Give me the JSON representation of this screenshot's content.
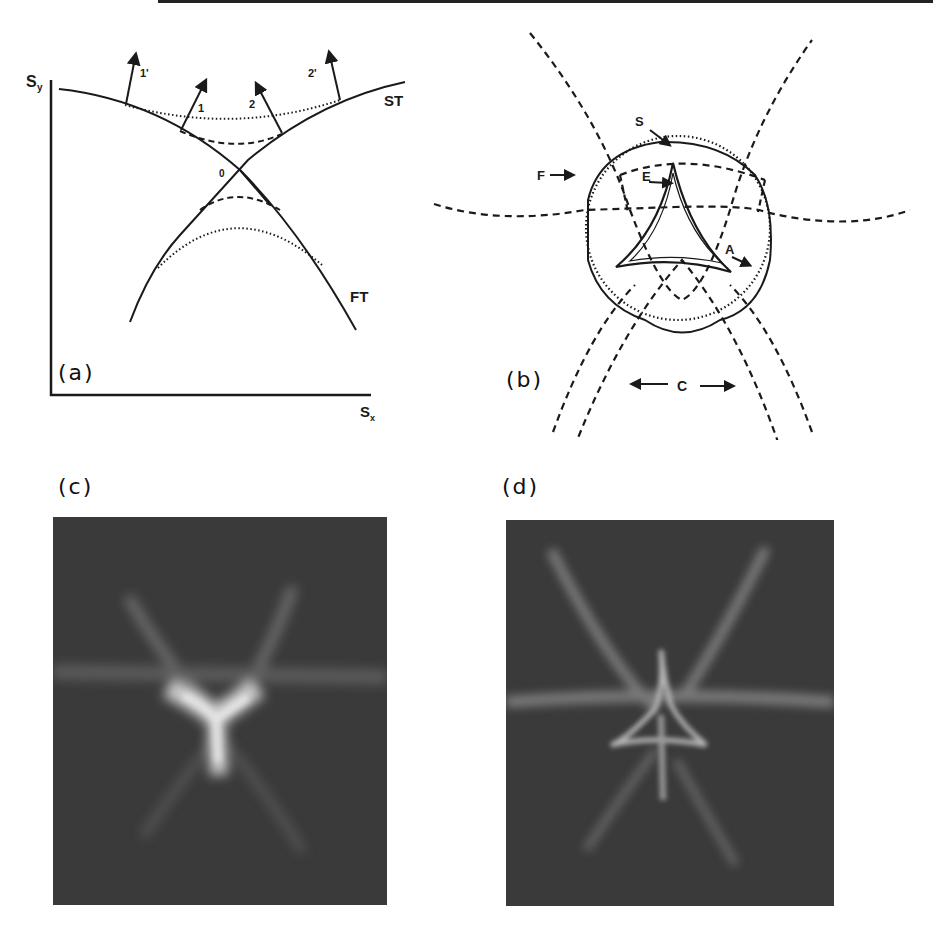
{
  "figure": {
    "panels": [
      {
        "id": "a",
        "label": "(a)",
        "type": "diagram",
        "axes": {
          "x_label": "S",
          "x_sub": "x",
          "y_label": "S",
          "y_sub": "y"
        },
        "curves": [
          {
            "name": "ST",
            "label": "ST",
            "style": "solid"
          },
          {
            "name": "FT",
            "label": "FT",
            "style": "solid"
          }
        ],
        "intersection_label": "0",
        "arrows": [
          {
            "label": "1'"
          },
          {
            "label": "1"
          },
          {
            "label": "2"
          },
          {
            "label": "2'"
          }
        ]
      },
      {
        "id": "b",
        "label": "(b)",
        "type": "diagram",
        "markers": [
          {
            "label": "S"
          },
          {
            "label": "F"
          },
          {
            "label": "E"
          },
          {
            "label": "A"
          },
          {
            "label": "C"
          }
        ]
      },
      {
        "id": "c",
        "label": "(c)",
        "type": "photograph",
        "description": "Y-shaped bright caustic on dark background"
      },
      {
        "id": "d",
        "label": "(d)",
        "type": "photograph",
        "description": "Star-shaped caustic with triangular centre on dark background"
      }
    ]
  },
  "colors": {
    "ink": "#1a1a1a",
    "photo_bg": "#3b3b3b",
    "glow": "#bdbdbd"
  }
}
